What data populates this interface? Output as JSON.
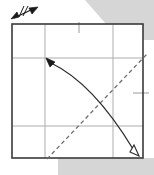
{
  "figure": {
    "title": "Origami fold step diagram",
    "caption": "",
    "background_color": "#ffffff",
    "shadow_color": "#d4d4d4",
    "paper_color": "#ffffff",
    "edge_color": "#3a3a3a",
    "crease_color": "#a8a8a8",
    "fold_line_color": "#6e6e6e",
    "arrow_color": "#2b2b2b",
    "paper": {
      "name": "square-sheet",
      "x": 12,
      "y": 24,
      "width": 131,
      "height": 134
    },
    "shadow_shapes": [
      {
        "name": "shadow-top-right",
        "points": "85,0 154,0 154,40 120,40"
      },
      {
        "name": "shadow-bottom",
        "points": "58,158 154,158 154,175 58,175"
      }
    ],
    "creases": [
      {
        "name": "crease-vertical-left",
        "orientation": "vertical",
        "x": 45,
        "y1": 24,
        "y2": 158
      },
      {
        "name": "crease-vertical-right",
        "orientation": "vertical",
        "x": 113,
        "y1": 24,
        "y2": 158
      },
      {
        "name": "crease-horizontal-top",
        "orientation": "horizontal",
        "y": 58,
        "x1": 12,
        "x2": 143
      },
      {
        "name": "crease-horizontal-bottom",
        "orientation": "horizontal",
        "y": 126,
        "x1": 12,
        "x2": 143
      }
    ],
    "tick_marks": [
      {
        "name": "tick-top-center",
        "x1": 79,
        "y1": 22,
        "x2": 79,
        "y2": 32
      },
      {
        "name": "tick-right-middle",
        "x1": 133,
        "y1": 93,
        "x2": 148,
        "y2": 93
      }
    ],
    "fold_line": {
      "name": "dashed-fold-line",
      "style": "dashed",
      "from_x": 47,
      "from_y": 158,
      "to_x": 146,
      "to_y": 55,
      "dash_pattern": "4 3"
    },
    "motion_arrow": {
      "name": "curved-fold-arrow",
      "style": "curved",
      "start_x": 50,
      "start_y": 62,
      "control_x": 92,
      "control_y": 82,
      "end_x": 134,
      "end_y": 150,
      "head_start": {
        "name": "solid-arrowhead",
        "fill": "solid",
        "x": 48,
        "y": 60
      },
      "head_end": {
        "name": "hollow-arrowhead",
        "fill": "hollow",
        "x": 137,
        "y": 153
      }
    },
    "corner_symbol": {
      "name": "fold-and-unfold-symbol",
      "x": 12,
      "y": 6,
      "width": 28,
      "height": 16,
      "description": "small double-headed arrow with hatch marks"
    }
  }
}
